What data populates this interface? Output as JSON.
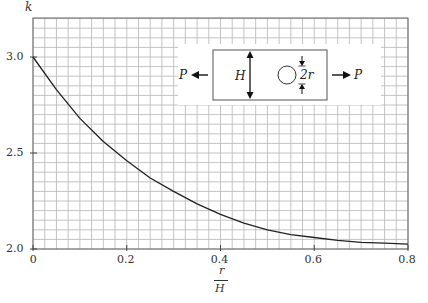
{
  "chart_data": {
    "type": "line",
    "title": "",
    "xlabel": "r/H",
    "ylabel": "k",
    "xlim": [
      0,
      0.8
    ],
    "ylim": [
      2.0,
      3.2
    ],
    "grid": true,
    "x_ticks": [
      "0",
      "0.2",
      "0.4",
      "0.6",
      "0.8"
    ],
    "y_ticks": [
      "2.0",
      "2.5",
      "3.0"
    ],
    "series": [
      {
        "name": "k",
        "x": [
          0,
          0.05,
          0.1,
          0.15,
          0.2,
          0.25,
          0.3,
          0.35,
          0.4,
          0.45,
          0.5,
          0.55,
          0.6,
          0.65,
          0.7,
          0.75,
          0.8
        ],
        "values": [
          3.0,
          2.83,
          2.68,
          2.56,
          2.46,
          2.37,
          2.3,
          2.235,
          2.18,
          2.135,
          2.1,
          2.075,
          2.06,
          2.045,
          2.035,
          2.03,
          2.025
        ]
      }
    ],
    "inset": {
      "description": "Plate of height H with central hole of diameter 2r under axial load P",
      "labels": {
        "load_left": "P",
        "load_right": "P",
        "height": "H",
        "hole": "2r"
      }
    }
  },
  "labels": {
    "y_axis": "k",
    "x_axis_num": "r",
    "x_axis_den": "H"
  }
}
